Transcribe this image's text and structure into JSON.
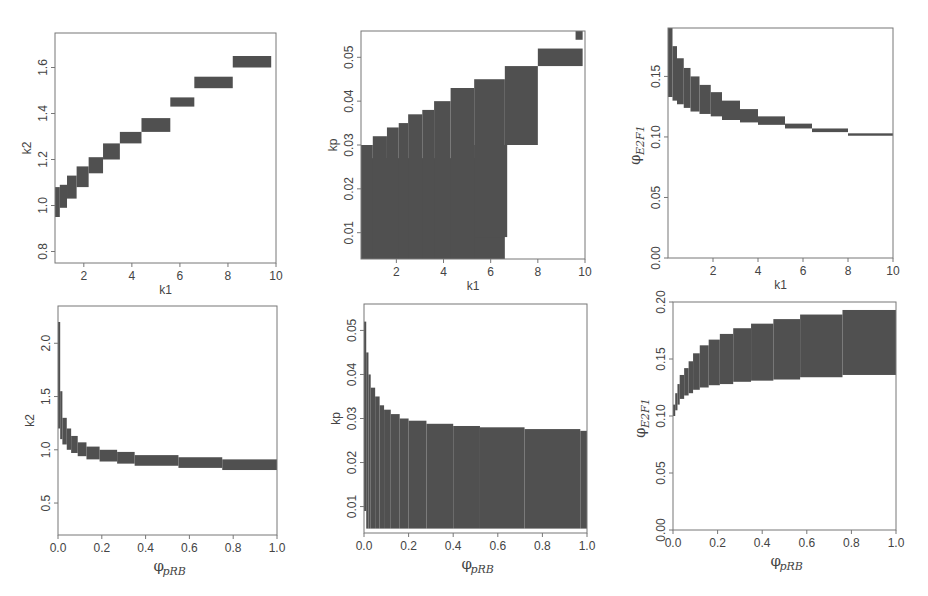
{
  "figure": {
    "layout": "2x3 grid of parameter-region plots",
    "fill_color": "#505050",
    "axis_color": "#777777"
  },
  "chart_data": [
    {
      "id": "p1",
      "type": "area",
      "xlabel": "k1",
      "ylabel": "k2",
      "xlim": [
        0.8,
        10
      ],
      "ylim": [
        0.75,
        1.75
      ],
      "xticks": [
        2,
        4,
        6,
        8,
        10
      ],
      "yticks": [
        0.8,
        1.0,
        1.2,
        1.4,
        1.6
      ],
      "grid": false,
      "description": "staircase band, k2 increasing with k1",
      "rects": [
        [
          0.8,
          0.95,
          1.0,
          1.08
        ],
        [
          1.0,
          0.99,
          1.3,
          1.09
        ],
        [
          1.3,
          1.03,
          1.7,
          1.13
        ],
        [
          1.7,
          1.08,
          2.2,
          1.17
        ],
        [
          2.2,
          1.14,
          2.8,
          1.21
        ],
        [
          2.8,
          1.2,
          3.5,
          1.27
        ],
        [
          3.5,
          1.27,
          4.4,
          1.32
        ],
        [
          4.4,
          1.32,
          5.6,
          1.38
        ],
        [
          5.6,
          1.43,
          6.6,
          1.47
        ],
        [
          6.6,
          1.51,
          8.2,
          1.56
        ],
        [
          8.2,
          1.6,
          9.8,
          1.65
        ]
      ]
    },
    {
      "id": "p2",
      "type": "area",
      "xlabel": "k1",
      "ylabel": "kp",
      "xlim": [
        0.5,
        10
      ],
      "ylim": [
        0.004,
        0.056
      ],
      "xticks": [
        2,
        4,
        6,
        8,
        10
      ],
      "yticks": [
        0.01,
        0.02,
        0.03,
        0.04,
        0.05
      ],
      "grid": false,
      "description": "large filled region with staircase upper boundary",
      "rects": [
        [
          0.5,
          0.004,
          5.4,
          0.027
        ],
        [
          0.5,
          0.004,
          1.0,
          0.03
        ],
        [
          1.0,
          0.004,
          1.6,
          0.032
        ],
        [
          1.6,
          0.004,
          2.1,
          0.034
        ],
        [
          2.1,
          0.004,
          2.5,
          0.035
        ],
        [
          2.5,
          0.004,
          3.1,
          0.037
        ],
        [
          3.1,
          0.004,
          3.6,
          0.038
        ],
        [
          3.6,
          0.004,
          4.3,
          0.04
        ],
        [
          4.3,
          0.004,
          5.3,
          0.043
        ],
        [
          5.3,
          0.004,
          6.6,
          0.045
        ],
        [
          5.3,
          0.009,
          6.7,
          0.03
        ],
        [
          6.6,
          0.03,
          8.0,
          0.048
        ],
        [
          8.0,
          0.048,
          9.9,
          0.052
        ],
        [
          9.6,
          0.054,
          9.9,
          0.056
        ]
      ]
    },
    {
      "id": "p3",
      "type": "area",
      "xlabel": "k1",
      "ylabel": "φE2F1",
      "xlim": [
        0,
        10
      ],
      "ylim": [
        0,
        0.19
      ],
      "xticks": [
        2,
        4,
        6,
        8,
        10
      ],
      "yticks": [
        0.0,
        0.05,
        0.1,
        0.15
      ],
      "grid": false,
      "description": "decreasing band of φE2F1 vs k1",
      "rects": [
        [
          0.0,
          0.133,
          0.2,
          0.19
        ],
        [
          0.2,
          0.13,
          0.4,
          0.175
        ],
        [
          0.4,
          0.127,
          0.7,
          0.165
        ],
        [
          0.7,
          0.124,
          1.0,
          0.157
        ],
        [
          1.0,
          0.121,
          1.4,
          0.15
        ],
        [
          1.4,
          0.119,
          1.9,
          0.143
        ],
        [
          1.9,
          0.117,
          2.4,
          0.137
        ],
        [
          2.4,
          0.114,
          3.2,
          0.13
        ],
        [
          3.2,
          0.112,
          4.0,
          0.123
        ],
        [
          4.0,
          0.11,
          5.2,
          0.117
        ],
        [
          5.2,
          0.107,
          6.4,
          0.111
        ],
        [
          6.4,
          0.104,
          8.0,
          0.107
        ],
        [
          8.0,
          0.101,
          10.0,
          0.103
        ]
      ]
    },
    {
      "id": "p4",
      "type": "area",
      "xlabel": "φpRB",
      "ylabel": "k2",
      "xlim": [
        0,
        1
      ],
      "ylim": [
        0.2,
        2.35
      ],
      "xticks": [
        0.0,
        0.2,
        0.4,
        0.6,
        0.8,
        1.0
      ],
      "yticks": [
        0.5,
        1.0,
        1.5,
        2.0
      ],
      "grid": false,
      "description": "decaying band k2 vs φpRB",
      "rects": [
        [
          0.0,
          1.2,
          0.01,
          2.2
        ],
        [
          0.01,
          1.1,
          0.02,
          1.55
        ],
        [
          0.02,
          1.05,
          0.04,
          1.3
        ],
        [
          0.04,
          1.0,
          0.06,
          1.2
        ],
        [
          0.06,
          0.97,
          0.09,
          1.13
        ],
        [
          0.09,
          0.94,
          0.13,
          1.07
        ],
        [
          0.13,
          0.91,
          0.19,
          1.03
        ],
        [
          0.19,
          0.89,
          0.27,
          1.0
        ],
        [
          0.27,
          0.87,
          0.35,
          0.98
        ],
        [
          0.35,
          0.85,
          0.55,
          0.95
        ],
        [
          0.55,
          0.83,
          0.75,
          0.93
        ],
        [
          0.75,
          0.81,
          1.0,
          0.91
        ]
      ]
    },
    {
      "id": "p5",
      "type": "area",
      "xlabel": "φpRB",
      "ylabel": "kp",
      "xlim": [
        0,
        1
      ],
      "ylim": [
        0.004,
        0.056
      ],
      "xticks": [
        0.0,
        0.2,
        0.4,
        0.6,
        0.8,
        1.0
      ],
      "yticks": [
        0.01,
        0.02,
        0.03,
        0.04,
        0.05
      ],
      "grid": false,
      "description": "filled region under decaying boundary",
      "rects": [
        [
          0.0,
          0.009,
          0.01,
          0.052
        ],
        [
          0.01,
          0.005,
          0.02,
          0.045
        ],
        [
          0.02,
          0.005,
          0.03,
          0.04
        ],
        [
          0.03,
          0.005,
          0.05,
          0.037
        ],
        [
          0.05,
          0.005,
          0.07,
          0.035
        ],
        [
          0.07,
          0.005,
          0.09,
          0.033
        ],
        [
          0.09,
          0.005,
          0.12,
          0.032
        ],
        [
          0.12,
          0.005,
          0.16,
          0.031
        ],
        [
          0.16,
          0.005,
          0.2,
          0.03
        ],
        [
          0.2,
          0.005,
          0.28,
          0.0295
        ],
        [
          0.28,
          0.005,
          0.4,
          0.0288
        ],
        [
          0.4,
          0.005,
          0.52,
          0.0283
        ],
        [
          0.52,
          0.005,
          0.72,
          0.028
        ],
        [
          0.72,
          0.005,
          0.97,
          0.0276
        ],
        [
          0.97,
          0.005,
          1.0,
          0.0272
        ]
      ]
    },
    {
      "id": "p6",
      "type": "area",
      "xlabel": "φpRB",
      "ylabel": "φE2F1",
      "xlim": [
        0,
        1
      ],
      "ylim": [
        0,
        0.2
      ],
      "xticks": [
        0.0,
        0.2,
        0.4,
        0.6,
        0.8,
        1.0
      ],
      "yticks": [
        0.0,
        0.05,
        0.1,
        0.15,
        0.2
      ],
      "grid": false,
      "description": "increasing band φE2F1 vs φpRB",
      "rects": [
        [
          0.0,
          0.1,
          0.01,
          0.11
        ],
        [
          0.01,
          0.105,
          0.02,
          0.12
        ],
        [
          0.02,
          0.11,
          0.03,
          0.128
        ],
        [
          0.03,
          0.115,
          0.05,
          0.136
        ],
        [
          0.05,
          0.118,
          0.07,
          0.142
        ],
        [
          0.07,
          0.12,
          0.09,
          0.148
        ],
        [
          0.09,
          0.123,
          0.12,
          0.155
        ],
        [
          0.12,
          0.125,
          0.16,
          0.162
        ],
        [
          0.16,
          0.127,
          0.21,
          0.167
        ],
        [
          0.21,
          0.128,
          0.27,
          0.172
        ],
        [
          0.27,
          0.13,
          0.35,
          0.177
        ],
        [
          0.35,
          0.131,
          0.45,
          0.181
        ],
        [
          0.45,
          0.132,
          0.57,
          0.185
        ],
        [
          0.57,
          0.134,
          0.76,
          0.189
        ],
        [
          0.76,
          0.136,
          1.0,
          0.193
        ]
      ]
    }
  ],
  "panels": [
    {
      "xlabel": "k1",
      "ylabel": "k2"
    },
    {
      "xlabel": "k1",
      "ylabel": "kp"
    },
    {
      "xlabel": "k1",
      "ylabel_main": "φ",
      "ylabel_sub": "E2F1"
    },
    {
      "xlabel_main": "φ",
      "xlabel_sub": "pRB",
      "ylabel": "k2"
    },
    {
      "xlabel_main": "φ",
      "xlabel_sub": "pRB",
      "ylabel": "kp"
    },
    {
      "xlabel_main": "φ",
      "xlabel_sub": "pRB",
      "ylabel_main": "φ",
      "ylabel_sub": "E2F1"
    }
  ]
}
